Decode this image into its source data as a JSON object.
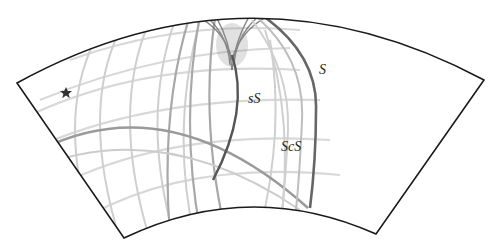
{
  "figure": {
    "type": "seismic-wavefield-cross-section",
    "labels": {
      "s": "S",
      "ss": "sS",
      "scs": "ScS"
    },
    "source_marker": "star-icon",
    "colors": {
      "outline": "#1a1a1a",
      "wavefront_dark": "#555555",
      "wavefront_mid": "#9a9a9a",
      "wavefront_light": "#d4d4d4",
      "background": "#ffffff",
      "star": "#333333"
    }
  }
}
